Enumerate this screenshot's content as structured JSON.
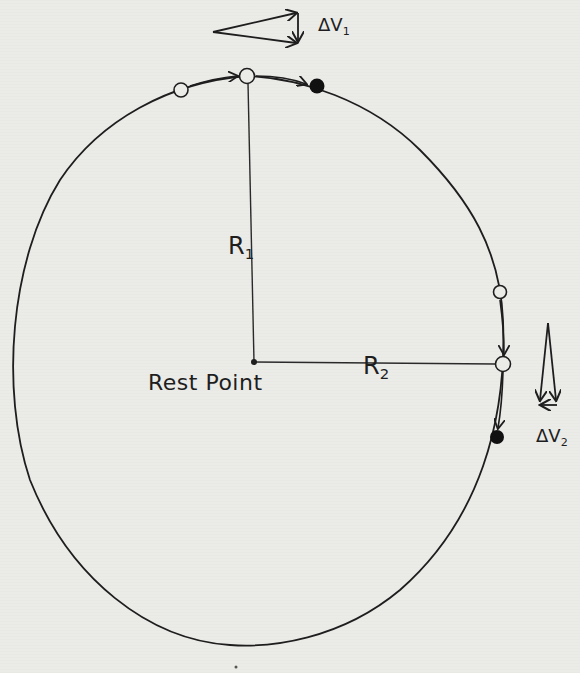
{
  "diagram": {
    "type": "hand-drawn orbital/circular motion diagram",
    "labels": {
      "r1": {
        "main": "R",
        "sub": "1"
      },
      "r2": {
        "main": "R",
        "sub": "2"
      },
      "rest_point": "Rest Point",
      "delta_v1": {
        "main": "ΔV",
        "sub": "1"
      },
      "delta_v2": {
        "main": "ΔV",
        "sub": "2"
      }
    },
    "colors": {
      "ink": "#1e1e1e",
      "paper": "#ebebe8"
    },
    "center": {
      "x": 254,
      "y": 362
    },
    "radius_r1_top": {
      "x": 245,
      "y": 76
    },
    "radius_r2_right": {
      "x": 503,
      "y": 364
    },
    "points": [
      {
        "id": "top-open-left",
        "x": 181,
        "y": 90,
        "filled": false
      },
      {
        "id": "top-open-center",
        "x": 247,
        "y": 76,
        "filled": false
      },
      {
        "id": "top-filled",
        "x": 317,
        "y": 86,
        "filled": true
      },
      {
        "id": "right-open-upper",
        "x": 500,
        "y": 292,
        "filled": false
      },
      {
        "id": "right-open-center",
        "x": 503,
        "y": 364,
        "filled": false
      },
      {
        "id": "right-filled",
        "x": 497,
        "y": 437,
        "filled": true
      }
    ],
    "vector_diagrams": [
      {
        "id": "dv1-triangle",
        "position": "top",
        "description": "two velocity arrows pointing right with small downward difference vector"
      },
      {
        "id": "dv2-triangle",
        "position": "right",
        "description": "two velocity arrows pointing down with small leftward difference vector"
      }
    ]
  }
}
